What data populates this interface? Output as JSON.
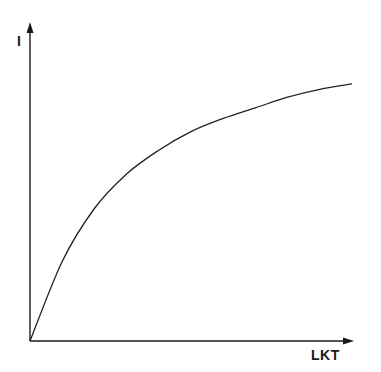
{
  "chart_data": {
    "type": "line",
    "title": "",
    "xlabel": "LKT",
    "ylabel": "I",
    "grid": false,
    "legend": null,
    "ticks": {
      "x": [],
      "y": []
    },
    "series": [
      {
        "name": "I vs LKT",
        "x": [
          0,
          0.1,
          0.2,
          0.3,
          0.4,
          0.5,
          0.6,
          0.7,
          0.8,
          0.9,
          1.0
        ],
        "y": [
          0,
          0.3,
          0.5,
          0.63,
          0.72,
          0.79,
          0.84,
          0.88,
          0.92,
          0.95,
          0.97
        ]
      }
    ],
    "xlim": [
      0,
      1.0
    ],
    "ylim": [
      0,
      1.2
    ]
  },
  "colors": {
    "axis": "#1a1a1a",
    "curve": "#222222",
    "background": "#ffffff"
  }
}
